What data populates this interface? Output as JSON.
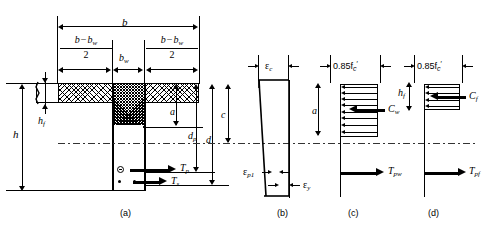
{
  "figure": {
    "panels": [
      {
        "id": "a",
        "label": "(a)",
        "caption": "cross section"
      },
      {
        "id": "b",
        "label": "(b)",
        "caption": "strain distribution"
      },
      {
        "id": "c",
        "label": "(c)",
        "caption": "web compression block"
      },
      {
        "id": "d",
        "label": "(d)",
        "caption": "flange compression block"
      }
    ]
  },
  "section": {
    "dimensions": {
      "b": "b",
      "bw": "b",
      "bw_sub": "w",
      "overhang_num_a": "b",
      "overhang_num_minus": "−",
      "overhang_num_b": "b",
      "overhang_num_b_sub": "w",
      "overhang_den": "2",
      "h": "h",
      "hf": "h",
      "hf_sub": "f",
      "a": "a",
      "c": "c",
      "d": "d",
      "dp": "d",
      "dp_sub": "p"
    },
    "forces": {
      "Tp": "T",
      "Tp_sub": "p",
      "Ts": "T",
      "Ts_sub": "s"
    }
  },
  "strain": {
    "ec": "ε",
    "ec_sub": "c",
    "ep1": "ε",
    "ep1_sub": "p1",
    "ey": "ε",
    "ey_sub": "y"
  },
  "web_block": {
    "stress": "0.85f",
    "stress_sub": "c",
    "stress_prime": "′",
    "a": "a",
    "Cw": "C",
    "Cw_sub": "w",
    "Tpw": "T",
    "Tpw_sub": "pw",
    "arrow_count": 8
  },
  "flange_block": {
    "stress": "0.85f",
    "stress_sub": "c",
    "stress_prime": "′",
    "hf": "h",
    "hf_sub": "f",
    "Cf": "C",
    "Cf_sub": "f",
    "Tpf": "T",
    "Tpf_sub": "pf",
    "arrow_count": 4
  },
  "colors": {
    "ink": "#000000",
    "paper": "#ffffff",
    "centerline": "#333333"
  }
}
